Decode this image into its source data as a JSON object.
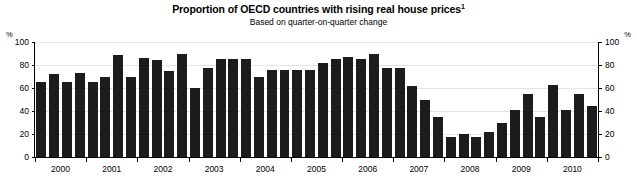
{
  "chart_data": {
    "type": "bar",
    "title": "Proportion of OECD countries with rising real house prices",
    "title_superscript": "1",
    "subtitle": "Based on quarter-on-quarter change",
    "xlabel": "",
    "ylabel": "%",
    "y_unit_left": "%",
    "y_unit_right": "%",
    "ylim": [
      0,
      100
    ],
    "yticks": [
      0,
      20,
      40,
      60,
      80,
      100
    ],
    "ytick_labels": [
      "0",
      "20",
      "40",
      "60",
      "80",
      "100"
    ],
    "grid": true,
    "legend": "none",
    "bar_color": "#1c1c1c",
    "x_categories": [
      "2000 Q1",
      "2000 Q2",
      "2000 Q3",
      "2000 Q4",
      "2001 Q1",
      "2001 Q2",
      "2001 Q3",
      "2001 Q4",
      "2002 Q1",
      "2002 Q2",
      "2002 Q3",
      "2002 Q4",
      "2003 Q1",
      "2003 Q2",
      "2003 Q3",
      "2003 Q4",
      "2004 Q1",
      "2004 Q2",
      "2004 Q3",
      "2004 Q4",
      "2005 Q1",
      "2005 Q2",
      "2005 Q3",
      "2005 Q4",
      "2006 Q1",
      "2006 Q2",
      "2006 Q3",
      "2006 Q4",
      "2007 Q1",
      "2007 Q2",
      "2007 Q3",
      "2007 Q4",
      "2008 Q1",
      "2008 Q2",
      "2008 Q3",
      "2008 Q4",
      "2009 Q1",
      "2009 Q2",
      "2009 Q3",
      "2009 Q4",
      "2010 Q1",
      "2010 Q2",
      "2010 Q3",
      "2010 Q4"
    ],
    "values": [
      65,
      72,
      65,
      73,
      65,
      70,
      89,
      70,
      86,
      84,
      75,
      90,
      60,
      77,
      85,
      85,
      85,
      70,
      76,
      76,
      76,
      76,
      82,
      85,
      87,
      85,
      90,
      77,
      77,
      62,
      50,
      35,
      17,
      20,
      17,
      22,
      30,
      41,
      55,
      35,
      63,
      41,
      55,
      44
    ],
    "xtick_year_labels": [
      "2000",
      "2001",
      "2002",
      "2003",
      "2004",
      "2005",
      "2006",
      "2007",
      "2008",
      "2009",
      "2010"
    ]
  }
}
